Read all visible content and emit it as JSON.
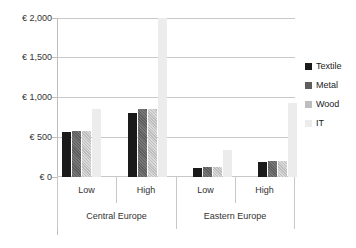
{
  "chart_data": {
    "type": "bar",
    "title": "",
    "xlabel": "",
    "ylabel": "",
    "ylim": [
      0,
      2000
    ],
    "grid": true,
    "legend_position": "right",
    "currency_symbol": "€",
    "y_ticks": [
      "€ 0",
      "€ 500",
      "€ 1,000",
      "€ 1,500",
      "€ 2,000"
    ],
    "y_tick_values": [
      0,
      500,
      1000,
      1500,
      2000
    ],
    "groups": [
      "Central Europe",
      "Eastern Europe"
    ],
    "subgroups": [
      "Low",
      "High"
    ],
    "categories": [
      "Central Europe – Low",
      "Central Europe – High",
      "Eastern Europe – Low",
      "Eastern Europe – High"
    ],
    "series": [
      {
        "name": "Textile",
        "color": "#1a1a1a",
        "values": [
          570,
          800,
          110,
          190
        ]
      },
      {
        "name": "Metal",
        "color": "#5e5e5e",
        "values": [
          575,
          850,
          120,
          200
        ]
      },
      {
        "name": "Wood",
        "color": "#bdbdbd",
        "values": [
          575,
          850,
          120,
          200
        ]
      },
      {
        "name": "IT",
        "color": "#ececec",
        "values": [
          850,
          2000,
          340,
          930
        ]
      }
    ]
  },
  "axis": {
    "labels": [
      {
        "text": "€ 2,000"
      },
      {
        "text": "€ 1,500"
      },
      {
        "text": "€ 1,000"
      },
      {
        "text": "€ 500"
      },
      {
        "text": "€ 0"
      }
    ]
  },
  "xaxis": {
    "tier1": [
      {
        "text": "Low"
      },
      {
        "text": "High"
      },
      {
        "text": "Low"
      },
      {
        "text": "High"
      }
    ],
    "tier2": [
      {
        "text": "Central Europe"
      },
      {
        "text": "Eastern Europe"
      }
    ]
  },
  "legend": {
    "items": [
      {
        "label": "Textile"
      },
      {
        "label": "Metal"
      },
      {
        "label": "Wood"
      },
      {
        "label": "IT"
      }
    ]
  }
}
